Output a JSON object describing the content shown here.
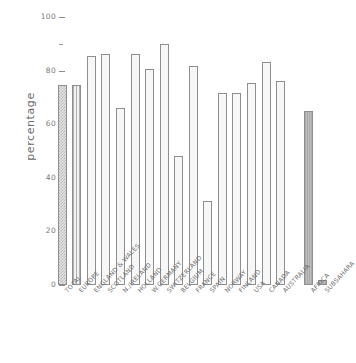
{
  "chart_data": {
    "type": "bar",
    "title": "",
    "xlabel": "",
    "ylabel": "percentage",
    "ylim": [
      0,
      100
    ],
    "ytick_labels": [
      "0",
      "20",
      "40",
      "60",
      "80",
      "100"
    ],
    "ytick_values": [
      0,
      20,
      40,
      60,
      80,
      100
    ],
    "yminor_values": [
      10,
      30,
      50,
      70,
      90
    ],
    "grid": false,
    "legend": "none",
    "categories": [
      "TOTAL",
      "EUROPE",
      "ENGLAND & WALES",
      "SCOTLAND",
      "N./IRELAND",
      "HOLLAND",
      "W.GERMANY",
      "SWITZERLAND",
      "BELGIUM",
      "FRANCE",
      "SPAIN",
      "NORWAY",
      "FINLAND",
      "USA",
      "CANADA",
      "AUSTRALIA",
      "AFRICA",
      "SUBSAHARA"
    ],
    "values": [
      74.8,
      74.8,
      85.6,
      86.3,
      66.0,
      86.3,
      80.6,
      89.9,
      48.2,
      81.7,
      31.3,
      71.5,
      71.5,
      75.5,
      83.4,
      76.2,
      65.0,
      2.0
    ],
    "bar_styles": [
      "check",
      "vline",
      "dot",
      "dot",
      "dot",
      "dot",
      "dot",
      "dot",
      "dot",
      "dot",
      "dot",
      "dot",
      "dot",
      "dot",
      "dot",
      "dot",
      "grey",
      "grey"
    ],
    "group_gap_after_index": 15,
    "colors": {
      "bar_outline": "#8e8e8e",
      "bar_light": "#f7f7f7",
      "bar_grey": "#b4b4b4",
      "axis": "#8c8c8c",
      "text": "#6e6e6e"
    }
  }
}
